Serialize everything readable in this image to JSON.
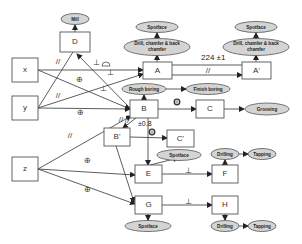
{
  "boxes": {
    "D": "D",
    "x": "x",
    "y": "y",
    "z": "z",
    "A": "A",
    "A_prime": "A'",
    "B": "B",
    "C": "C",
    "B_prime": "B'",
    "C_prime": "C'",
    "E": "E",
    "F": "F",
    "G": "G",
    "H": "H"
  },
  "ellipses": {
    "mill": "Mill",
    "spotface_A": "Spotface",
    "drill_A_1": "Drill, chamfer & back",
    "drill_A_2": "chamfer",
    "spotface_A_prime": "Spotface",
    "drill_A_prime_1": "Drill, chamfer & back",
    "drill_A_prime_2": "chamfer",
    "rough_boring": "Rough boring",
    "finish_boring": "Finish boring",
    "grooving": "Grooving",
    "spotface_E": "Spotface",
    "drilling_F": "Drilling",
    "tapping_F": "Tapping",
    "spotface_G": "Spotface",
    "drilling_H": "Drilling",
    "tapping_H": "Tapping"
  },
  "symbols": {
    "parallel": "//",
    "perpendicular": "⊥",
    "position": "⊕",
    "concentric": "◎",
    "profile": "⌓"
  },
  "dimensions": {
    "A_to_A_prime": "224 ±1",
    "B_tolerance": "±0.8"
  },
  "colors": {
    "ellipse_fill": "#d4d4d4",
    "line": "#333333",
    "box_stroke": "#555555"
  }
}
